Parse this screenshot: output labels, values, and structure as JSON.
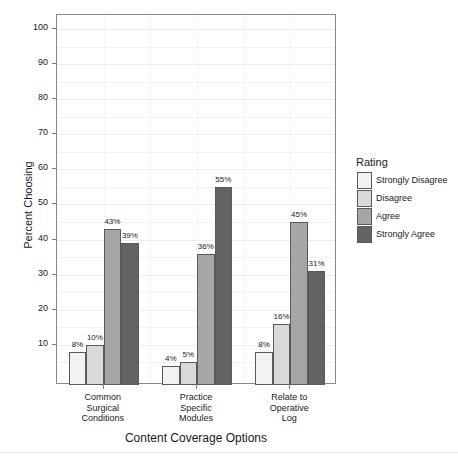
{
  "chart_data": {
    "type": "bar",
    "title": "",
    "xlabel": "Content Coverage Options",
    "ylabel": "Percent Choosing",
    "categories": [
      "Common Surgical Conditions",
      "Practice Specific Modules",
      "Relate to Operative Log"
    ],
    "category_lines": [
      [
        "Common",
        "Surgical",
        "Conditions"
      ],
      [
        "Practice",
        "Specific",
        "Modules"
      ],
      [
        "Relate to",
        "Operative",
        "Log"
      ]
    ],
    "series": [
      {
        "name": "Strongly Disagree",
        "color": "#f2f2f2",
        "values": [
          8,
          4,
          8
        ],
        "labels": [
          "8%",
          "4%",
          "8%"
        ]
      },
      {
        "name": "Disagree",
        "color": "#d9d9d9",
        "values": [
          10,
          5,
          16
        ],
        "labels": [
          "10%",
          "5%",
          "16%"
        ]
      },
      {
        "name": "Agree",
        "color": "#a6a6a6",
        "values": [
          43,
          36,
          45
        ],
        "labels": [
          "43%",
          "36%",
          "45%"
        ]
      },
      {
        "name": "Strongly Agree",
        "color": "#636363",
        "values": [
          39,
          55,
          31
        ],
        "labels": [
          "39%",
          "55%",
          "31%"
        ]
      }
    ],
    "ylim": [
      -1.5,
      104
    ],
    "yticks": [
      10,
      20,
      30,
      40,
      50,
      60,
      70,
      80,
      90,
      100
    ],
    "ytick_labels": [
      "10",
      "20",
      "30",
      "40",
      "50",
      "60",
      "70",
      "80",
      "90",
      "100"
    ],
    "grid": true,
    "legend": {
      "title": "Rating",
      "position": "right"
    }
  },
  "legend": {
    "title": "Rating",
    "items": [
      {
        "label": "Strongly Disagree",
        "swatch": "sd"
      },
      {
        "label": "Disagree",
        "swatch": "d"
      },
      {
        "label": "Agree",
        "swatch": "a"
      },
      {
        "label": "Strongly Agree",
        "swatch": "sa"
      }
    ]
  },
  "axes": {
    "y_title": "Percent Choosing",
    "x_title": "Content Coverage Options"
  }
}
